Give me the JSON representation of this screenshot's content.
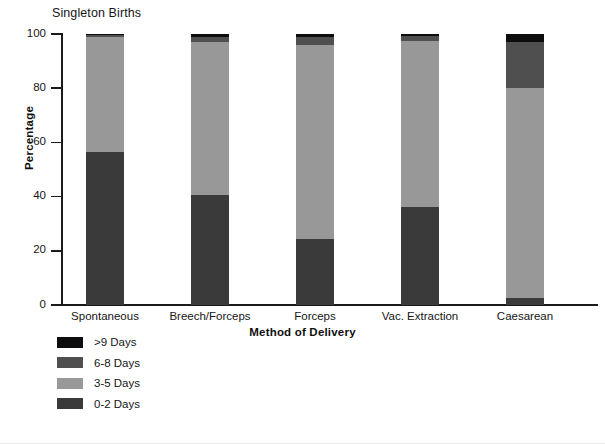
{
  "chart_data": {
    "type": "bar",
    "subtype": "stacked-100-percent",
    "title": "Singleton Births",
    "xlabel": "Method of Delivery",
    "ylabel": "Percentage",
    "ylim": [
      0,
      100
    ],
    "yticks": [
      0,
      20,
      40,
      60,
      80,
      100
    ],
    "grid": false,
    "legend_position": "below-plot-left",
    "categories": [
      "Spontaneous",
      "Breech/Forceps",
      "Forceps",
      "Vac. Extraction",
      "Caesarean"
    ],
    "series": [
      {
        "name": "0-2 Days",
        "color": "#3a3a3a",
        "values": [
          56.5,
          40.5,
          24.5,
          36.0,
          2.5
        ]
      },
      {
        "name": "3-5 Days",
        "color": "#989898",
        "values": [
          42.5,
          56.5,
          71.5,
          61.5,
          77.5
        ]
      },
      {
        "name": "6-8 Days",
        "color": "#4f4f4f",
        "values": [
          0.7,
          2.0,
          3.0,
          1.7,
          17.0
        ]
      },
      {
        "name": ">9 Days",
        "color": "#0d0d0d",
        "values": [
          0.3,
          1.0,
          1.0,
          0.8,
          3.0
        ]
      }
    ],
    "legend_entries": [
      {
        "label": ">9 Days",
        "color": "#0d0d0d"
      },
      {
        "label": "6-8 Days",
        "color": "#4f4f4f"
      },
      {
        "label": "3-5 Days",
        "color": "#989898"
      },
      {
        "label": "0-2 Days",
        "color": "#3a3a3a"
      }
    ]
  },
  "axis": {
    "tick_labels": [
      "0",
      "20",
      "40",
      "60",
      "80",
      "100"
    ]
  }
}
